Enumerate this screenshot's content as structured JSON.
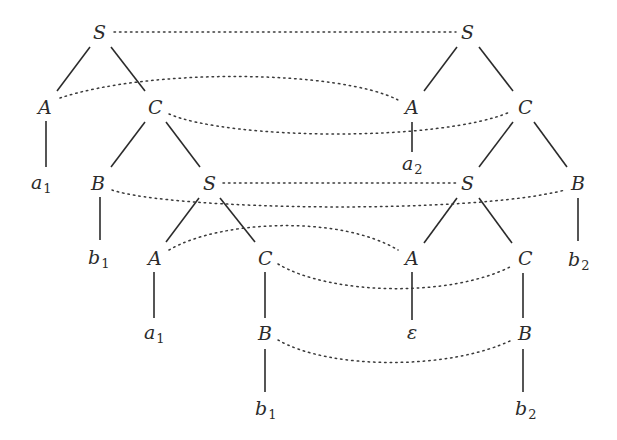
{
  "diagram": {
    "type": "parallel-derivation-trees",
    "left_tree": {
      "nodes": [
        {
          "id": "L_S1",
          "label": "S",
          "x": 100,
          "y": 32
        },
        {
          "id": "L_A1",
          "label": "A",
          "x": 45,
          "y": 107
        },
        {
          "id": "L_C1",
          "label": "C",
          "x": 155,
          "y": 107
        },
        {
          "id": "L_a1",
          "label": "a",
          "sub": "1",
          "x": 40,
          "y": 183
        },
        {
          "id": "L_B1",
          "label": "B",
          "x": 98,
          "y": 183
        },
        {
          "id": "L_S2",
          "label": "S",
          "x": 210,
          "y": 183
        },
        {
          "id": "L_b1",
          "label": "b",
          "sub": "1",
          "x": 96,
          "y": 258
        },
        {
          "id": "L_A2",
          "label": "A",
          "x": 155,
          "y": 258
        },
        {
          "id": "L_C2",
          "label": "C",
          "x": 265,
          "y": 258
        },
        {
          "id": "L_a1b",
          "label": "a",
          "sub": "1",
          "x": 153,
          "y": 333
        },
        {
          "id": "L_B2",
          "label": "B",
          "x": 265,
          "y": 333
        },
        {
          "id": "L_b1b",
          "label": "b",
          "sub": "1",
          "x": 263,
          "y": 410
        }
      ],
      "edges": [
        [
          "L_S1",
          "L_A1"
        ],
        [
          "L_S1",
          "L_C1"
        ],
        [
          "L_A1",
          "L_a1"
        ],
        [
          "L_C1",
          "L_B1"
        ],
        [
          "L_C1",
          "L_S2"
        ],
        [
          "L_B1",
          "L_b1"
        ],
        [
          "L_S2",
          "L_A2"
        ],
        [
          "L_S2",
          "L_C2"
        ],
        [
          "L_A2",
          "L_a1b"
        ],
        [
          "L_C2",
          "L_B2"
        ],
        [
          "L_B2",
          "L_b1b"
        ]
      ]
    },
    "right_tree": {
      "nodes": [
        {
          "id": "R_S1",
          "label": "S",
          "x": 468,
          "y": 32
        },
        {
          "id": "R_A1",
          "label": "A",
          "x": 412,
          "y": 107
        },
        {
          "id": "R_C1",
          "label": "C",
          "x": 525,
          "y": 107
        },
        {
          "id": "R_a2",
          "label": "a",
          "sub": "2",
          "x": 410,
          "y": 183
        },
        {
          "id": "R_S2",
          "label": "S",
          "x": 468,
          "y": 183
        },
        {
          "id": "R_B1",
          "label": "B",
          "x": 578,
          "y": 183
        },
        {
          "id": "R_b2",
          "label": "b",
          "sub": "2",
          "x": 576,
          "y": 260
        },
        {
          "id": "R_A2",
          "label": "A",
          "x": 412,
          "y": 258
        },
        {
          "id": "R_C2",
          "label": "C",
          "x": 525,
          "y": 258
        },
        {
          "id": "R_eps",
          "label": "ε",
          "x": 412,
          "y": 333
        },
        {
          "id": "R_B2",
          "label": "B",
          "x": 525,
          "y": 333
        },
        {
          "id": "R_b2b",
          "label": "b",
          "sub": "2",
          "x": 523,
          "y": 410
        }
      ],
      "edges": [
        [
          "R_S1",
          "R_A1"
        ],
        [
          "R_S1",
          "R_C1"
        ],
        [
          "R_A1",
          "R_a2"
        ],
        [
          "R_C1",
          "R_S2"
        ],
        [
          "R_C1",
          "R_B1"
        ],
        [
          "R_B1",
          "R_b2"
        ],
        [
          "R_S2",
          "R_A2"
        ],
        [
          "R_S2",
          "R_C2"
        ],
        [
          "R_A2",
          "R_eps"
        ],
        [
          "R_C2",
          "R_B2"
        ],
        [
          "R_B2",
          "R_b2b"
        ]
      ]
    },
    "links": [
      [
        "L_S1",
        "R_S1"
      ],
      [
        "L_A1",
        "R_A1"
      ],
      [
        "L_C1",
        "R_C1"
      ],
      [
        "L_B1",
        "R_B1"
      ],
      [
        "L_S2",
        "R_S2"
      ],
      [
        "L_A2",
        "R_A2"
      ],
      [
        "L_C2",
        "R_C2"
      ],
      [
        "L_B2",
        "R_B2"
      ]
    ]
  }
}
